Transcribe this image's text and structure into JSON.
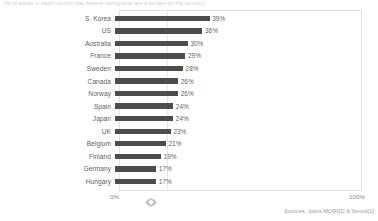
{
  "caption": "(% of adults in each country that believe immigrants are a burden on the country)",
  "chart_data": {
    "type": "bar",
    "orientation": "horizontal",
    "title": "",
    "subtitle": "",
    "xlabel": "",
    "ylabel": "",
    "xlim": [
      0,
      100
    ],
    "xtick_labels": [
      "0%",
      "100%"
    ],
    "grid": true,
    "gridlines_at": [
      20
    ],
    "legend": null,
    "value_suffix": "%",
    "bar_color": "#4d4d4d",
    "categories": [
      "S. Korea",
      "US",
      "Australia",
      "France",
      "Sweden",
      "Canada",
      "Norway",
      "Spain",
      "Japan",
      "UK",
      "Belgium",
      "Finland",
      "Germany",
      "Hungary"
    ],
    "values": [
      39,
      36,
      30,
      29,
      28,
      26,
      26,
      24,
      24,
      23,
      21,
      19,
      17,
      17
    ],
    "value_labels": [
      "39%",
      "36%",
      "30%",
      "29%",
      "28%",
      "26%",
      "26%",
      "24%",
      "24%",
      "23%",
      "21%",
      "19%",
      "17%",
      "17%"
    ]
  },
  "axis": {
    "min_label": "0%",
    "max_label": "100%"
  },
  "footer": {
    "sources": "Sources: Ipsos MORI[1] & Novus[1]"
  },
  "watermark": {
    "icon": "diamond-gem-logo-icon"
  }
}
